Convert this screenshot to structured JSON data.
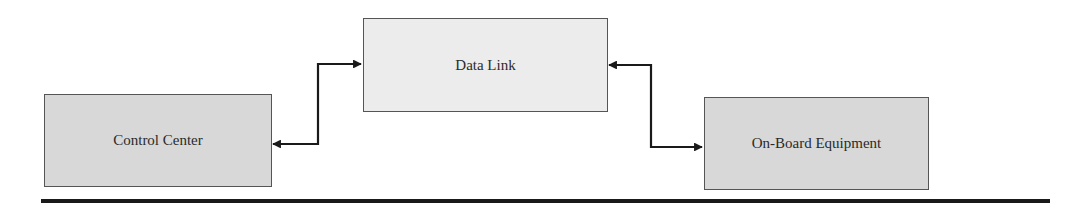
{
  "diagram": {
    "nodes": [
      {
        "id": "control-center",
        "label": "Control Center"
      },
      {
        "id": "data-link",
        "label": "Data Link"
      },
      {
        "id": "on-board-equipment",
        "label": "On-Board Equipment"
      }
    ],
    "edges": [
      {
        "from": "control-center",
        "to": "data-link",
        "bidirectional": true
      },
      {
        "from": "data-link",
        "to": "on-board-equipment",
        "bidirectional": true
      }
    ],
    "colors": {
      "box_dark_fill": "#d8d8d8",
      "box_light_fill": "#ececec",
      "box_border": "#555555",
      "connector": "#1a1a1a",
      "rule": "#1a1a1a"
    }
  }
}
